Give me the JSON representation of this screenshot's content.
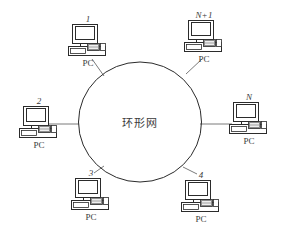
{
  "figure": {
    "type": "network-topology-diagram",
    "center_label": "环形网",
    "ellipse": {
      "cx": 140,
      "cy": 122,
      "rx": 61.5,
      "ry": 60
    },
    "stroke_color": "#2b2b2b",
    "line_color": "#6b6b6b",
    "background": "#ffffff"
  },
  "nodes": [
    {
      "id": "node-1",
      "number": "1",
      "label": "PC",
      "x": 57,
      "y": 14,
      "link": {
        "x1": 92,
        "y1": 59,
        "x2": 104,
        "y2": 76
      }
    },
    {
      "id": "node-np1",
      "number": "N+1",
      "label": "PC",
      "x": 173,
      "y": 10,
      "link": {
        "x1": 202,
        "y1": 59,
        "x2": 186,
        "y2": 74
      }
    },
    {
      "id": "node-2",
      "number": "2",
      "label": "PC",
      "x": 8,
      "y": 96,
      "link": {
        "x1": 48,
        "y1": 124,
        "x2": 79,
        "y2": 124
      }
    },
    {
      "id": "node-n",
      "number": "N",
      "label": "PC",
      "x": 218,
      "y": 92,
      "link": {
        "x1": 200,
        "y1": 124,
        "x2": 232,
        "y2": 124
      }
    },
    {
      "id": "node-3",
      "number": "3",
      "label": "PC",
      "x": 60,
      "y": 168,
      "link": {
        "x1": 94,
        "y1": 173,
        "x2": 104,
        "y2": 166
      }
    },
    {
      "id": "node-4",
      "number": "4",
      "label": "PC",
      "x": 170,
      "y": 170,
      "link": {
        "x1": 197,
        "y1": 174,
        "x2": 183,
        "y2": 167
      }
    }
  ]
}
